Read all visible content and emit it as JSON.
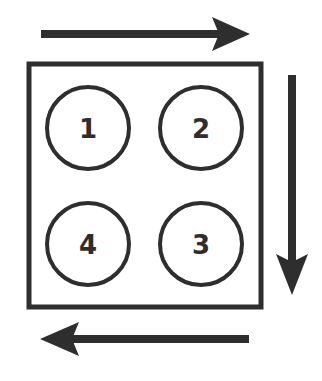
{
  "diagram": {
    "type": "rotation-order",
    "stroke_color": "#2e2e2e",
    "background": "#ffffff",
    "container": {
      "x": 29,
      "y": 64,
      "width": 232,
      "height": 243
    },
    "slots": [
      {
        "label": "1",
        "cx": 88,
        "cy": 128,
        "r": 42
      },
      {
        "label": "2",
        "cx": 201,
        "cy": 128,
        "r": 42
      },
      {
        "label": "3",
        "cx": 201,
        "cy": 244,
        "r": 42
      },
      {
        "label": "4",
        "cx": 88,
        "cy": 244,
        "r": 42
      }
    ],
    "arrows": [
      {
        "name": "top-arrow",
        "direction": "right"
      },
      {
        "name": "right-arrow",
        "direction": "down"
      },
      {
        "name": "bottom-arrow",
        "direction": "left"
      }
    ]
  }
}
